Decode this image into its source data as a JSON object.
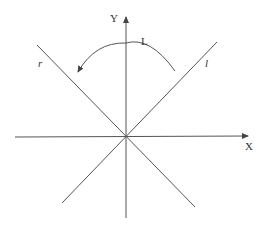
{
  "diagram": {
    "axes": {
      "x_label": "X",
      "y_label": "Y"
    },
    "lines": [
      {
        "id": "l",
        "label": "l"
      },
      {
        "id": "r",
        "label": "r"
      }
    ],
    "rotation": {
      "label": "L",
      "direction": "counterclockwise, from line l toward line r"
    },
    "colors": {
      "stroke": "#555555",
      "text": "#333333",
      "background": "#ffffff"
    }
  }
}
